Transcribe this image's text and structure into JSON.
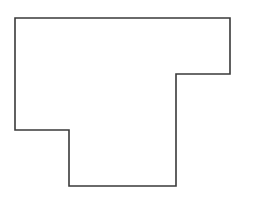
{
  "diagram": {
    "type": "polygon-outline",
    "shape": "T-shaped rectilinear polygon",
    "background_color": "#ffffff",
    "fill_color": "#ffffff",
    "stroke_color": "#3a3a3a",
    "stroke_width": 1.6,
    "vertices": [
      [
        15,
        18
      ],
      [
        230,
        18
      ],
      [
        230,
        74
      ],
      [
        176,
        74
      ],
      [
        176,
        186
      ],
      [
        69,
        186
      ],
      [
        69,
        130
      ],
      [
        15,
        130
      ]
    ]
  }
}
